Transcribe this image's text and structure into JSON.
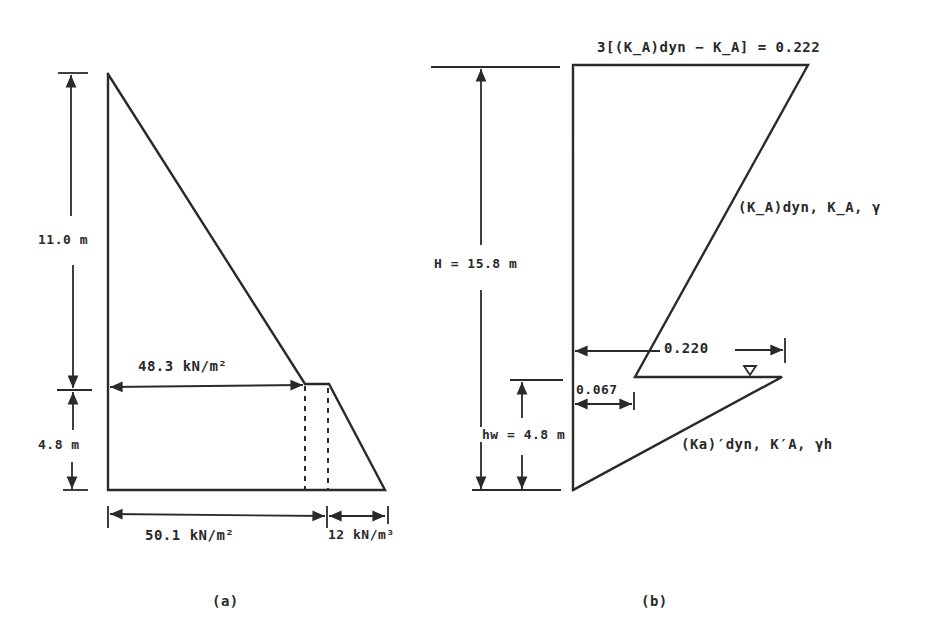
{
  "figure_a": {
    "caption": "(a)",
    "labels": {
      "top_height": "11.0 m",
      "bottom_height": "4.8 m",
      "pressure_at_water": "48.3 kN/m²",
      "pressure_at_base": "50.1 kN/m²",
      "water_unit_weight": "12 kN/m³"
    }
  },
  "figure_b": {
    "caption": "(b)",
    "labels": {
      "top_value": "3[(K_A)dyn − K_A] = 0.222",
      "upper_line": "(K_A)dyn, K_A, γ",
      "total_height": "H = 15.8 m",
      "water_height": "hw = 4.8 m",
      "width_at_water": "0.220",
      "offset_at_water": "0.067",
      "lower_line": "(Ka)′dyn, K′A, γh",
      "water_symbol": "∇"
    }
  },
  "colors": {
    "ink": "#2a2a2a",
    "background": "#ffffff"
  }
}
